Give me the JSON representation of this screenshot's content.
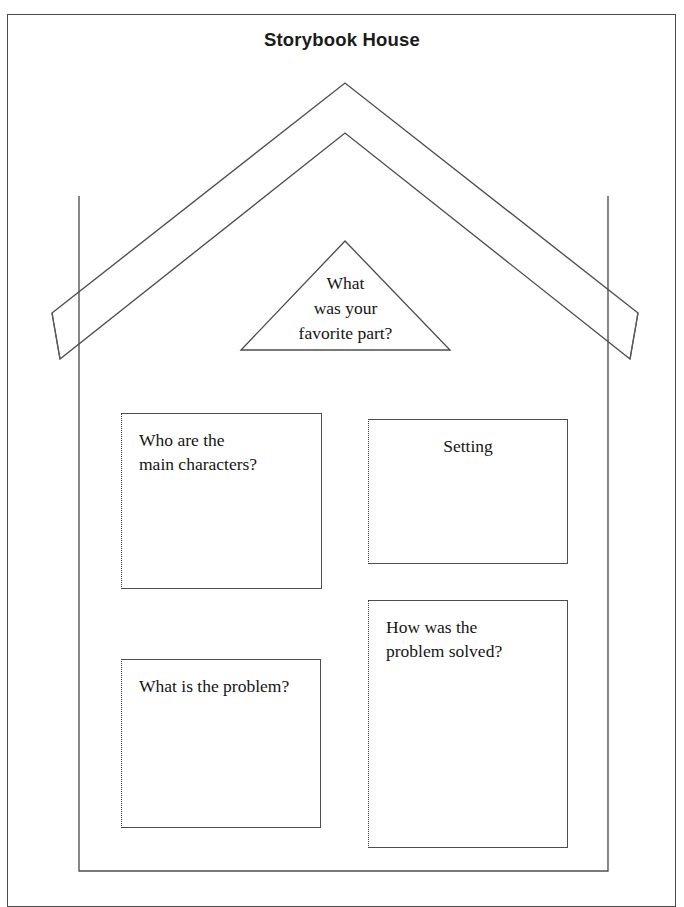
{
  "page": {
    "title": "Storybook House",
    "border_color": "#4a4a4a",
    "ink_color": "#4d4d4d",
    "background_color": "#ffffff"
  },
  "attic": {
    "name": "favorite-part-prompt",
    "lines": [
      "What",
      "was your",
      "favorite part?"
    ],
    "align": "center"
  },
  "windows": [
    {
      "id": "characters",
      "lines": [
        "Who are the",
        "main characters?"
      ],
      "align": "left"
    },
    {
      "id": "setting",
      "lines": [
        "Setting"
      ],
      "align": "center"
    },
    {
      "id": "problem",
      "lines": [
        "What is the problem?"
      ],
      "align": "left"
    },
    {
      "id": "solution",
      "lines": [
        "How was the",
        "problem solved?"
      ],
      "align": "left"
    }
  ]
}
